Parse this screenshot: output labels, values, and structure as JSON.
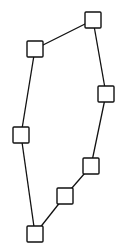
{
  "diagram": {
    "type": "graph",
    "width": 123,
    "height": 252,
    "background": "#ffffff",
    "stroke_color": "#111111",
    "node_fill": "#ffffff",
    "node_size": 16,
    "nodes": [
      {
        "id": "n1",
        "cx": 35,
        "cy": 49
      },
      {
        "id": "n2",
        "cx": 93,
        "cy": 20
      },
      {
        "id": "n3",
        "cx": 106,
        "cy": 94
      },
      {
        "id": "n4",
        "cx": 91,
        "cy": 166
      },
      {
        "id": "n5",
        "cx": 65,
        "cy": 196
      },
      {
        "id": "n6",
        "cx": 35,
        "cy": 234
      },
      {
        "id": "n7",
        "cx": 21,
        "cy": 135
      }
    ],
    "edges": [
      {
        "from": "n1",
        "to": "n2"
      },
      {
        "from": "n2",
        "to": "n3"
      },
      {
        "from": "n3",
        "to": "n4"
      },
      {
        "from": "n4",
        "to": "n5"
      },
      {
        "from": "n5",
        "to": "n6"
      },
      {
        "from": "n6",
        "to": "n7"
      },
      {
        "from": "n7",
        "to": "n1"
      }
    ]
  }
}
